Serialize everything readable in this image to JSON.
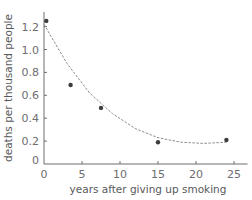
{
  "chart_data": {
    "type": "scatter",
    "title": "",
    "xlabel": "years after giving up smoking",
    "ylabel": "deaths per thousand people",
    "xlim": [
      0,
      26
    ],
    "ylim": [
      0,
      1.3
    ],
    "x_ticks": [
      0,
      5,
      10,
      15,
      20,
      25
    ],
    "y_ticks": [
      0,
      0.2,
      0.4,
      0.6,
      0.8,
      1.0,
      1.2
    ],
    "x_tick_labels": [
      "0",
      "5",
      "10",
      "15",
      "20",
      "25"
    ],
    "y_tick_labels": [
      "0",
      "0.2",
      "0.4",
      "0.6",
      "0.8",
      "1.0",
      "1.2"
    ],
    "grid": false,
    "legend": null,
    "series": [
      {
        "name": "observed",
        "type": "scatter",
        "points": [
          {
            "x": 0.3,
            "y": 1.25
          },
          {
            "x": 3.5,
            "y": 0.69
          },
          {
            "x": 7.5,
            "y": 0.49
          },
          {
            "x": 15.0,
            "y": 0.19
          },
          {
            "x": 24.0,
            "y": 0.21
          }
        ]
      },
      {
        "name": "trend curve",
        "type": "line",
        "style": "dashed",
        "points": [
          {
            "x": 0,
            "y": 1.22
          },
          {
            "x": 3,
            "y": 0.88
          },
          {
            "x": 6,
            "y": 0.62
          },
          {
            "x": 9,
            "y": 0.44
          },
          {
            "x": 12,
            "y": 0.31
          },
          {
            "x": 15,
            "y": 0.23
          },
          {
            "x": 18,
            "y": 0.19
          },
          {
            "x": 21,
            "y": 0.18
          },
          {
            "x": 24,
            "y": 0.19
          }
        ]
      }
    ],
    "colors": {
      "axis": "#6d6e70",
      "point": "#3d3d3f",
      "curve": "#8a8b8d"
    }
  }
}
